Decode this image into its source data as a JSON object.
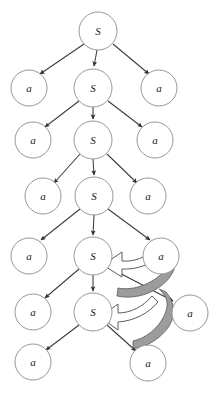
{
  "figure": {
    "type": "diagram",
    "canvas": {
      "width": 219,
      "height": 396,
      "background": "#ffffff"
    },
    "style": {
      "node_stroke": "#8a8a8a",
      "node_fill": "#ffffff",
      "edge_color": "#3a3a3a",
      "block_arrow_fill": "#9c9c9c",
      "block_arrow_hollow_fill": "#ffffff",
      "block_arrow_stroke": "#5a5a5a",
      "node_radius": 18
    },
    "nodes": [
      {
        "id": "s0",
        "label": "S",
        "x": 98,
        "y": 31,
        "r": 19,
        "row": 0,
        "kind": "nonterminal"
      },
      {
        "id": "a1l",
        "label": "a",
        "x": 29,
        "y": 88,
        "r": 18,
        "row": 1,
        "kind": "terminal"
      },
      {
        "id": "s1",
        "label": "S",
        "x": 93,
        "y": 88,
        "r": 19,
        "row": 1,
        "kind": "nonterminal"
      },
      {
        "id": "a1r",
        "label": "a",
        "x": 159,
        "y": 88,
        "r": 18,
        "row": 1,
        "kind": "terminal"
      },
      {
        "id": "a2l",
        "label": "a",
        "x": 33,
        "y": 140,
        "r": 18,
        "row": 2,
        "kind": "terminal"
      },
      {
        "id": "s2",
        "label": "S",
        "x": 93,
        "y": 140,
        "r": 19,
        "row": 2,
        "kind": "nonterminal"
      },
      {
        "id": "a2r",
        "label": "a",
        "x": 155,
        "y": 140,
        "r": 18,
        "row": 2,
        "kind": "terminal"
      },
      {
        "id": "a3l",
        "label": "a",
        "x": 43,
        "y": 196,
        "r": 18,
        "row": 3,
        "kind": "terminal"
      },
      {
        "id": "s3",
        "label": "S",
        "x": 94,
        "y": 196,
        "r": 19,
        "row": 3,
        "kind": "nonterminal"
      },
      {
        "id": "a3r",
        "label": "a",
        "x": 148,
        "y": 196,
        "r": 18,
        "row": 3,
        "kind": "terminal"
      },
      {
        "id": "a4l",
        "label": "a",
        "x": 29,
        "y": 256,
        "r": 18,
        "row": 4,
        "kind": "terminal"
      },
      {
        "id": "s4",
        "label": "S",
        "x": 93,
        "y": 256,
        "r": 19,
        "row": 4,
        "kind": "nonterminal"
      },
      {
        "id": "a4r",
        "label": "a",
        "x": 161,
        "y": 256,
        "r": 18,
        "row": 4,
        "kind": "terminal"
      },
      {
        "id": "a5l",
        "label": "a",
        "x": 33,
        "y": 312,
        "r": 18,
        "row": 5,
        "kind": "terminal"
      },
      {
        "id": "s5",
        "label": "S",
        "x": 93,
        "y": 312,
        "r": 19,
        "row": 5,
        "kind": "nonterminal"
      },
      {
        "id": "a5r",
        "label": "a",
        "x": 190,
        "y": 313,
        "r": 18,
        "row": 5,
        "kind": "terminal"
      },
      {
        "id": "a6l",
        "label": "a",
        "x": 33,
        "y": 362,
        "r": 18,
        "row": 6,
        "kind": "terminal"
      },
      {
        "id": "a6r",
        "label": "a",
        "x": 148,
        "y": 363,
        "r": 18,
        "row": 6,
        "kind": "terminal"
      }
    ],
    "edges": [
      {
        "from": "s0",
        "to": "a1l"
      },
      {
        "from": "s0",
        "to": "s1"
      },
      {
        "from": "s0",
        "to": "a1r"
      },
      {
        "from": "s1",
        "to": "a2l"
      },
      {
        "from": "s1",
        "to": "s2"
      },
      {
        "from": "s1",
        "to": "a2r"
      },
      {
        "from": "s2",
        "to": "a3l"
      },
      {
        "from": "s2",
        "to": "s3"
      },
      {
        "from": "s2",
        "to": "a3r"
      },
      {
        "from": "s3",
        "to": "a4l"
      },
      {
        "from": "s3",
        "to": "s4"
      },
      {
        "from": "s3",
        "to": "a4r"
      },
      {
        "from": "s4",
        "to": "a5l"
      },
      {
        "from": "s4",
        "to": "s5"
      },
      {
        "from": "s4",
        "to": "a5r"
      },
      {
        "from": "s5",
        "to": "a6l"
      },
      {
        "from": "s5",
        "to": "a6r"
      }
    ],
    "loop_arrows": [
      {
        "id": "loop-upper",
        "from": "a4r",
        "to": "s4",
        "note": "curved block arrow pointing back to S"
      },
      {
        "id": "loop-lower",
        "from": "a6r",
        "to": "s5",
        "note": "curved block arrow pointing back to S"
      }
    ]
  }
}
